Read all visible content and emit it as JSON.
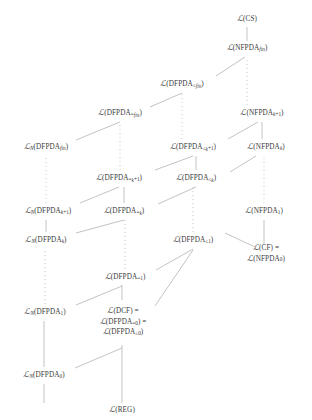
{
  "figure": {
    "type": "hasse-diagram",
    "title": "",
    "background_color": "#ffffff",
    "line_color": "#9a9a9a",
    "text_color": "#3a3a3a",
    "width": 312,
    "height": 420
  },
  "nodes": [
    {
      "id": "cs",
      "label": "ℒ(CS)",
      "x": 247,
      "y": 19,
      "lines": [
        "ℒ(CS)"
      ]
    },
    {
      "id": "nfpda_fin",
      "label": "ℒ(NFPDA_fin)",
      "x": 247,
      "y": 48,
      "lines": [
        "ℒ(NFPDA_fin)"
      ]
    },
    {
      "id": "dfpda_le_fin",
      "label": "ℒ(DFPDA_≤fin)",
      "x": 182,
      "y": 84,
      "lines": [
        "ℒ(DFPDA_≤fin)"
      ]
    },
    {
      "id": "nfpda_k1",
      "label": "ℒ(NFPDA_k+1)",
      "x": 262,
      "y": 113,
      "lines": [
        "ℒ(NFPDA_k+1)"
      ]
    },
    {
      "id": "dfpda_eq_fin",
      "label": "ℒ(DFPDA_=fin)",
      "x": 120,
      "y": 113,
      "lines": [
        "ℒ(DFPDA_=fin)"
      ]
    },
    {
      "id": "ln_dfpda_fin",
      "label": "ℒ_N(DFPDA_fin)",
      "x": 46,
      "y": 147,
      "lines": [
        "ℒ_N(DFPDA_fin)"
      ]
    },
    {
      "id": "dfpda_le_k1",
      "label": "ℒ(DFPDA_≤k+1)",
      "x": 193,
      "y": 147,
      "lines": [
        "ℒ(DFPDA_≤k+1)"
      ]
    },
    {
      "id": "nfpda_k",
      "label": "ℒ(NFPDA_k)",
      "x": 266,
      "y": 147,
      "lines": [
        "ℒ(NFPDA_k)"
      ]
    },
    {
      "id": "dfpda_eq_k1",
      "label": "ℒ(DFPDA_=k+1)",
      "x": 119,
      "y": 178,
      "lines": [
        "ℒ(DFPDA_=k+1)"
      ]
    },
    {
      "id": "dfpda_le_k",
      "label": "ℒ(DFPDA_≤k)",
      "x": 196,
      "y": 178,
      "lines": [
        "ℒ(DFPDA_≤k)"
      ]
    },
    {
      "id": "ln_dfpda_k1",
      "label": "ℒ_N(DFPDA_k+1)",
      "x": 48,
      "y": 211,
      "lines": [
        "ℒ_N(DFPDA_k+1)"
      ]
    },
    {
      "id": "dfpda_eq_k",
      "label": "ℒ(DFPDA_=k)",
      "x": 124,
      "y": 211,
      "lines": [
        "ℒ(DFPDA_=k)"
      ]
    },
    {
      "id": "nfpda_1",
      "label": "ℒ(NFPDA_1)",
      "x": 264,
      "y": 211,
      "lines": [
        "ℒ(NFPDA_1)"
      ]
    },
    {
      "id": "ln_dfpda_k",
      "label": "ℒ_N(DFPDA_k)",
      "x": 46,
      "y": 240,
      "lines": [
        "ℒ_N(DFPDA_k)"
      ]
    },
    {
      "id": "dfpda_le_1",
      "label": "ℒ(DFPDA_≤1)",
      "x": 193,
      "y": 240,
      "lines": [
        "ℒ(DFPDA_≤1)"
      ]
    },
    {
      "id": "cf_nfpda_0",
      "label": "ℒ(CF) = ℒ(NFPDA_0)",
      "x": 266,
      "y": 253,
      "lines": [
        "ℒ(CF) =",
        "ℒ(NFPDA_0)"
      ]
    },
    {
      "id": "dfpda_eq_1",
      "label": "ℒ(DFPDA_=1)",
      "x": 125,
      "y": 277,
      "lines": [
        "ℒ(DFPDA_=1)"
      ]
    },
    {
      "id": "ln_dfpda_1",
      "label": "ℒ_N(DFPDA_1)",
      "x": 45,
      "y": 312,
      "lines": [
        "ℒ_N(DFPDA_1)"
      ]
    },
    {
      "id": "dcf",
      "label": "ℒ(DCF) = ℒ(DFPDA_=0) = ℒ(DFPDA_≤0)",
      "x": 123,
      "y": 322,
      "lines": [
        "ℒ(DCF) =",
        "ℒ(DFPDA_=0) =",
        "ℒ(DFPDA_≤0)"
      ]
    },
    {
      "id": "ln_dfpda_0",
      "label": "ℒ_N(DFPDA_0)",
      "x": 44,
      "y": 375,
      "lines": [
        "ℒ_N(DFPDA_0)"
      ]
    },
    {
      "id": "reg",
      "label": "ℒ(REG)",
      "x": 122,
      "y": 410,
      "lines": [
        "ℒ(REG)"
      ]
    }
  ],
  "edges": [
    {
      "from": "reg",
      "to": "ln_dfpda_0",
      "style": "solid",
      "note": "vertical-left"
    },
    {
      "from": "reg",
      "to": "dcf",
      "style": "solid",
      "note": "vertical"
    },
    {
      "from": "ln_dfpda_0",
      "to": "ln_dfpda_1",
      "style": "solid",
      "note": "vertical"
    },
    {
      "from": "ln_dfpda_0",
      "to": "dcf",
      "style": "solid",
      "note": "diagonal-up-right"
    },
    {
      "from": "dcf",
      "to": "dfpda_eq_1",
      "style": "solid",
      "note": "vertical"
    },
    {
      "from": "ln_dfpda_1",
      "to": "dfpda_eq_1",
      "style": "solid",
      "note": "diagonal-up-right"
    },
    {
      "from": "ln_dfpda_1",
      "to": "ln_dfpda_k",
      "style": "dotted",
      "note": "vertical-dotted"
    },
    {
      "from": "dfpda_eq_1",
      "to": "dfpda_le_1",
      "style": "solid",
      "note": "diagonal-up-right"
    },
    {
      "from": "dfpda_eq_1",
      "to": "dfpda_eq_k",
      "style": "dotted",
      "note": "vertical-dotted"
    },
    {
      "from": "dcf",
      "to": "dfpda_le_1",
      "style": "solid",
      "note": "diagonal-up-right"
    },
    {
      "from": "dfpda_le_1",
      "to": "cf_nfpda_0",
      "style": "solid",
      "note": "diagonal-up-right"
    },
    {
      "from": "dfpda_le_1",
      "to": "dfpda_le_k",
      "style": "dotted",
      "note": "vertical-dotted"
    },
    {
      "from": "cf_nfpda_0",
      "to": "nfpda_1",
      "style": "solid",
      "note": "vertical"
    },
    {
      "from": "nfpda_1",
      "to": "nfpda_k",
      "style": "dotted",
      "note": "vertical-dotted"
    },
    {
      "from": "ln_dfpda_k",
      "to": "ln_dfpda_k1",
      "style": "solid",
      "note": "vertical"
    },
    {
      "from": "ln_dfpda_k",
      "to": "dfpda_eq_k",
      "style": "solid",
      "note": "diagonal-up-right"
    },
    {
      "from": "dfpda_eq_k",
      "to": "dfpda_eq_k1",
      "style": "solid",
      "note": "vertical"
    },
    {
      "from": "ln_dfpda_k1",
      "to": "dfpda_eq_k1",
      "style": "solid",
      "note": "diagonal-up-right"
    },
    {
      "from": "dfpda_eq_k",
      "to": "dfpda_le_k",
      "style": "solid",
      "note": "diagonal-up-right"
    },
    {
      "from": "dfpda_le_k",
      "to": "dfpda_le_k1",
      "style": "solid",
      "note": "vertical"
    },
    {
      "from": "dfpda_eq_k1",
      "to": "dfpda_le_k1",
      "style": "solid",
      "note": "diagonal-up-right"
    },
    {
      "from": "dfpda_le_k",
      "to": "nfpda_k",
      "style": "solid",
      "note": "diagonal-up-right"
    },
    {
      "from": "nfpda_k",
      "to": "nfpda_k1",
      "style": "solid",
      "note": "vertical"
    },
    {
      "from": "dfpda_le_k1",
      "to": "nfpda_k1",
      "style": "solid",
      "note": "diagonal-up-right"
    },
    {
      "from": "ln_dfpda_k1",
      "to": "ln_dfpda_fin",
      "style": "dotted",
      "note": "vertical-dotted"
    },
    {
      "from": "dfpda_eq_k1",
      "to": "dfpda_eq_fin",
      "style": "dotted",
      "note": "vertical-dotted"
    },
    {
      "from": "dfpda_le_k1",
      "to": "dfpda_le_fin",
      "style": "dotted",
      "note": "vertical-dotted"
    },
    {
      "from": "nfpda_k1",
      "to": "nfpda_fin",
      "style": "dotted",
      "note": "vertical-dotted"
    },
    {
      "from": "ln_dfpda_fin",
      "to": "dfpda_eq_fin",
      "style": "solid",
      "note": "diagonal-up-right"
    },
    {
      "from": "dfpda_eq_fin",
      "to": "dfpda_le_fin",
      "style": "solid",
      "note": "diagonal-up-right"
    },
    {
      "from": "dfpda_le_fin",
      "to": "nfpda_fin",
      "style": "solid",
      "note": "diagonal-up-right"
    },
    {
      "from": "nfpda_fin",
      "to": "cs",
      "style": "solid",
      "note": "vertical"
    }
  ]
}
